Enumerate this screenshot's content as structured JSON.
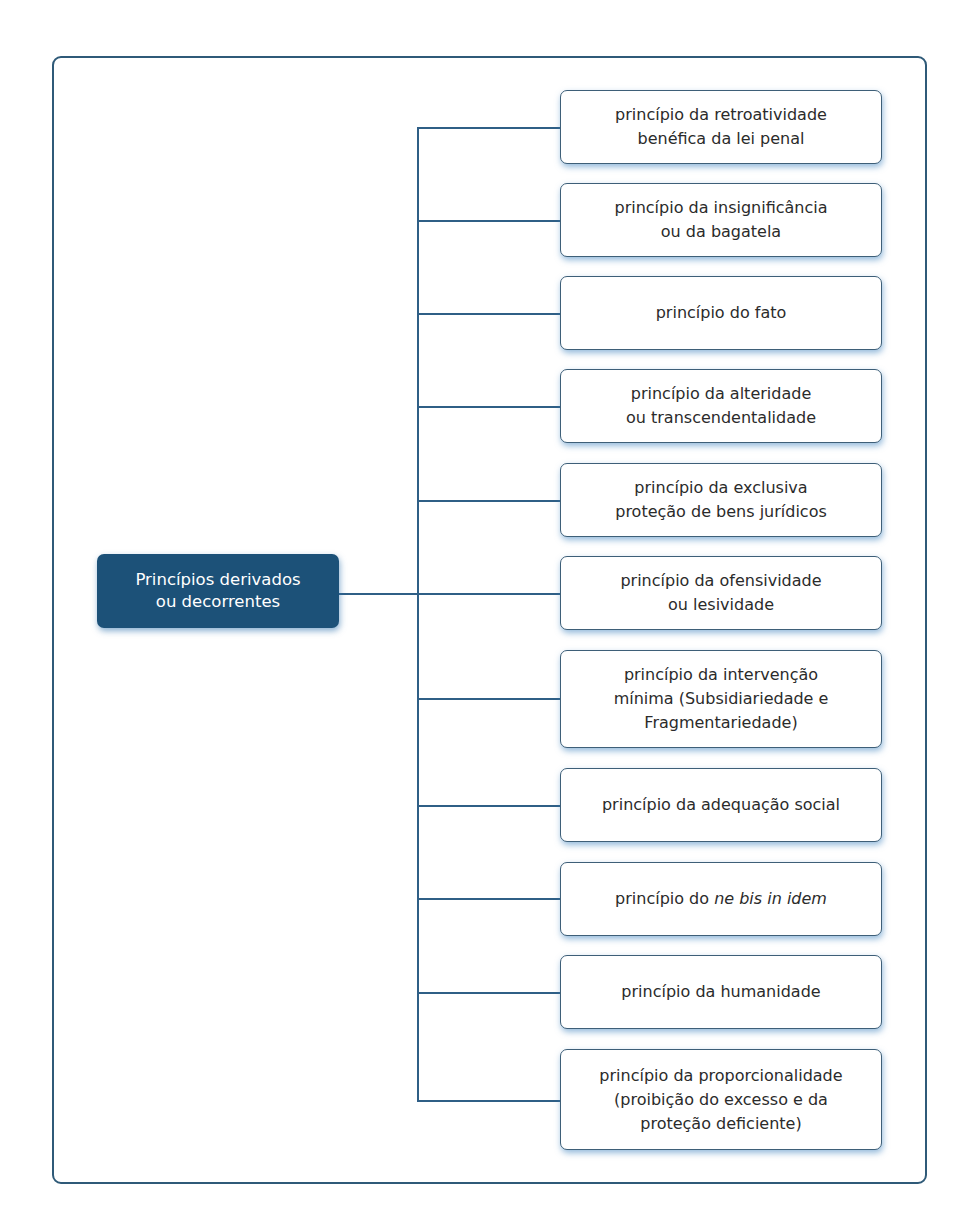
{
  "diagram": {
    "root": {
      "line1": "Princípios derivados",
      "line2": "ou decorrentes"
    },
    "colors": {
      "root_fill": "#1c5178",
      "border": "#3e5f78",
      "connector": "#2f5f86",
      "frame": "#2f5a78"
    },
    "nodes": [
      {
        "line1": "princípio da retroatividade",
        "line2": "benéfica da lei penal"
      },
      {
        "line1": "princípio da insignificância",
        "line2": "ou da bagatela"
      },
      {
        "line1": "princípio do fato"
      },
      {
        "line1": "princípio da alteridade",
        "line2": "ou transcendentalidade"
      },
      {
        "line1": "princípio da exclusiva",
        "line2": "proteção de bens jurídicos"
      },
      {
        "line1": "princípio da ofensividade",
        "line2": "ou lesividade"
      },
      {
        "line1": "princípio da intervenção",
        "line2": "mínima (Subsidiariedade e",
        "line3": "Fragmentariedade)"
      },
      {
        "line1": "princípio da adequação social"
      },
      {
        "prefix": "princípio do ",
        "italic": "ne bis in idem"
      },
      {
        "line1": "princípio da humanidade"
      },
      {
        "line1": "princípio da proporcionalidade",
        "line2": "(proibição do excesso e da",
        "line3": "proteção deficiente)"
      }
    ]
  }
}
